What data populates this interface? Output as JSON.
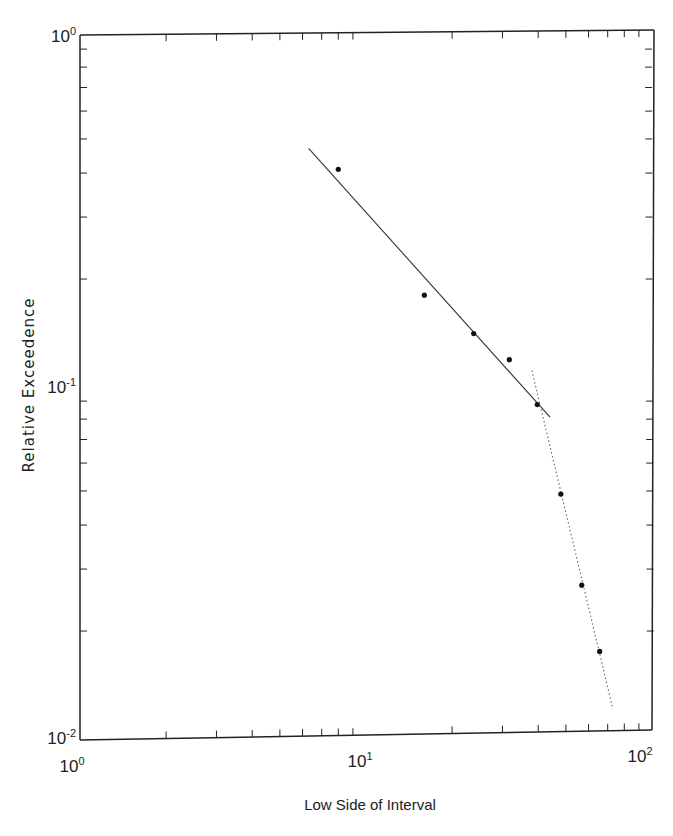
{
  "chart_data": {
    "type": "scatter",
    "title": "",
    "xlabel": "Low Side of Interval",
    "ylabel": "Relative Exceedence",
    "xscale": "log",
    "yscale": "log",
    "xlim": [
      1,
      100
    ],
    "ylim": [
      0.01,
      1
    ],
    "x_ticks": [
      {
        "base": "10",
        "exp": "0"
      },
      {
        "base": "10",
        "exp": "1"
      },
      {
        "base": "10",
        "exp": "2"
      }
    ],
    "y_ticks": [
      {
        "base": "10",
        "exp": "0"
      },
      {
        "base": "10",
        "exp": "-1"
      },
      {
        "base": "10",
        "exp": "-2"
      }
    ],
    "grid": false,
    "legend": null,
    "series": [
      {
        "name": "observed",
        "style": "points",
        "x": [
          8.0,
          16.0,
          23.8,
          31.7,
          39.7,
          48.0,
          56.8,
          65.6
        ],
        "y": [
          0.41,
          0.18,
          0.14,
          0.118,
          0.088,
          0.049,
          0.027,
          0.0175
        ]
      },
      {
        "name": "fit-lower-range",
        "style": "solid-line",
        "x": [
          6.3,
          44.0
        ],
        "y": [
          0.47,
          0.081
        ]
      },
      {
        "name": "fit-upper-range",
        "style": "dotted-line",
        "x": [
          38.0,
          73.0
        ],
        "y": [
          0.11,
          0.012
        ]
      }
    ]
  }
}
